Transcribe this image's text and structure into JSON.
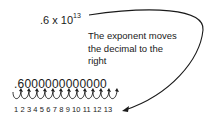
{
  "expression": {
    "base": ".6 x 10",
    "exponent": "13"
  },
  "caption": [
    "The exponent moves",
    "the decimal to the",
    "right"
  ],
  "expanded_number": ".6000000000000",
  "place_counts": "1 2 3 4 5 6 7 8 9 10 11 12 13",
  "colors": {
    "ink": "#1a1a1a",
    "background": "#ffffff"
  }
}
